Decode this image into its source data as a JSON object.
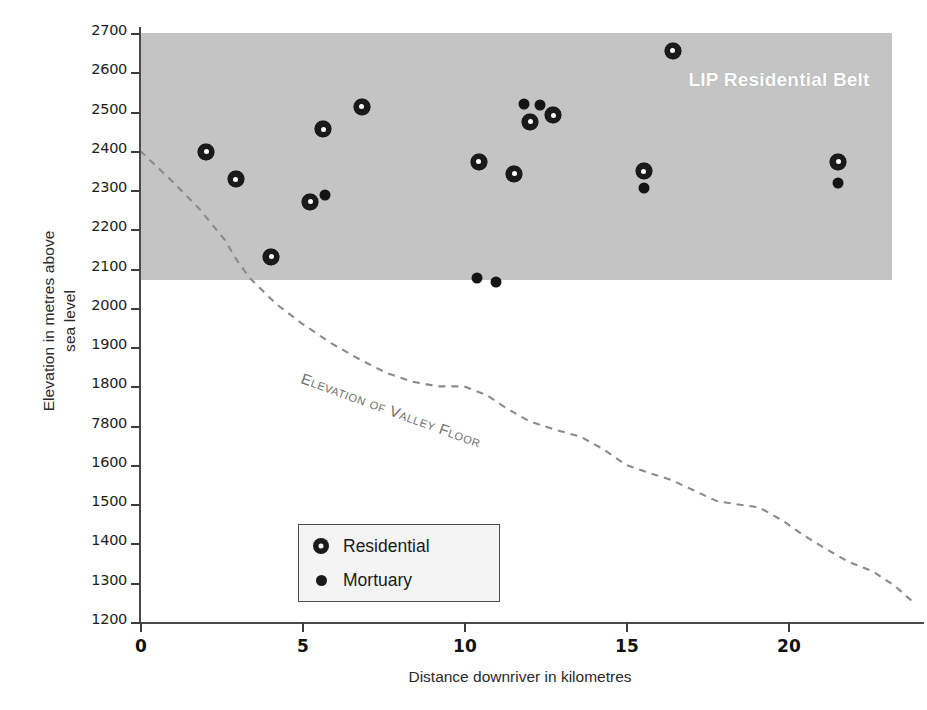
{
  "chart_data": {
    "type": "scatter",
    "title": "",
    "xlabel": "Distance downriver in kilometres",
    "ylabel": "Elevation in metres above sea level",
    "ylabel_lines": [
      "Elevation in metres above",
      "sea level"
    ],
    "xlim": [
      0,
      24.2
    ],
    "ylim": [
      1200,
      2700
    ],
    "grid": false,
    "xticks": [
      0,
      5,
      10,
      15,
      20
    ],
    "xtick_labels": [
      "0",
      "5",
      "10",
      "15",
      "20"
    ],
    "yticks": [
      1200,
      1300,
      1400,
      1500,
      1600,
      1700,
      1800,
      1900,
      2000,
      2100,
      2200,
      2300,
      2400,
      2500,
      2600,
      2700
    ],
    "ytick_labels": [
      "1200",
      "1300",
      "1400",
      "1500",
      "1600",
      "7800",
      "1800",
      "1900",
      "2000",
      "2100",
      "2200",
      "2300",
      "2400",
      "2500",
      "2600",
      "2700"
    ],
    "legend_position": "lower-left",
    "series": [
      {
        "name": "Residential",
        "marker": "ring",
        "color": "#1a1a1a",
        "points": [
          {
            "x": 2.05,
            "y": 2398
          },
          {
            "x": 2.95,
            "y": 2328
          },
          {
            "x": 4.05,
            "y": 2130
          },
          {
            "x": 5.25,
            "y": 2270
          },
          {
            "x": 5.65,
            "y": 2455
          },
          {
            "x": 6.85,
            "y": 2512
          },
          {
            "x": 10.45,
            "y": 2372
          },
          {
            "x": 11.55,
            "y": 2342
          },
          {
            "x": 12.05,
            "y": 2474
          },
          {
            "x": 12.75,
            "y": 2490
          },
          {
            "x": 15.55,
            "y": 2348
          },
          {
            "x": 16.45,
            "y": 2655
          },
          {
            "x": 21.55,
            "y": 2372
          }
        ]
      },
      {
        "name": "Mortuary",
        "marker": "dot",
        "color": "#141414",
        "points": [
          {
            "x": 5.7,
            "y": 2287
          },
          {
            "x": 10.4,
            "y": 2075
          },
          {
            "x": 11.0,
            "y": 2065
          },
          {
            "x": 11.85,
            "y": 2520
          },
          {
            "x": 12.35,
            "y": 2516
          },
          {
            "x": 15.55,
            "y": 2305
          },
          {
            "x": 21.55,
            "y": 2318
          }
        ]
      }
    ],
    "bands": [
      {
        "name": "LIP Residential Belt",
        "label": "LIP Residential Belt",
        "y_top": 2700,
        "y_bottom": 2070,
        "x_start": 0,
        "x_end": 23.2,
        "color": "#bfbfbf",
        "label_color": "#ffffff"
      }
    ],
    "annotated_lines": [
      {
        "name": "Elevation of Valley Floor",
        "label": "Elevation of Valley Floor",
        "style": "dashed",
        "color": "#8a8a8a",
        "x": [
          0.0,
          0.9,
          1.8,
          2.6,
          3.0,
          3.4,
          4.2,
          5.0,
          5.9,
          6.8,
          7.6,
          8.4,
          9.2,
          10.0,
          10.7,
          11.3,
          12.0,
          12.8,
          13.6,
          14.3,
          15.0,
          15.7,
          16.4,
          17.1,
          17.8,
          18.4,
          19.1,
          19.8,
          20.5,
          21.2,
          21.9,
          22.6,
          23.3,
          23.9
        ],
        "y": [
          2400,
          2330,
          2255,
          2175,
          2120,
          2075,
          2010,
          1960,
          1910,
          1868,
          1835,
          1812,
          1800,
          1800,
          1778,
          1745,
          1712,
          1690,
          1672,
          1640,
          1600,
          1580,
          1562,
          1535,
          1508,
          1500,
          1492,
          1460,
          1420,
          1385,
          1352,
          1330,
          1292,
          1248
        ]
      }
    ]
  },
  "legend": {
    "items": [
      {
        "label": "Residential",
        "marker": "ring"
      },
      {
        "label": "Mortuary",
        "marker": "dot"
      }
    ]
  }
}
